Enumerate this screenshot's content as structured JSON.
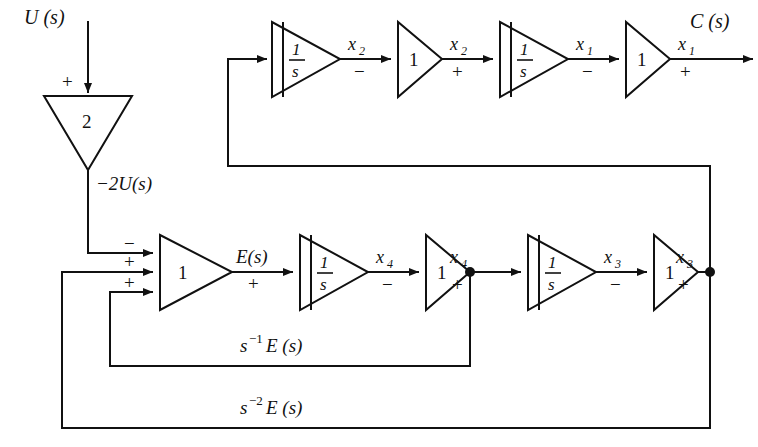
{
  "figure": {
    "kind": "signal-flow-block-diagram",
    "background_color": "#ffffff",
    "line_color": "#111111"
  },
  "signals": {
    "input": "U (s)",
    "output": "C (s)",
    "gain_out": "−2U(s)",
    "error": "E(s)",
    "state_x1": "x",
    "state_x1_sub": "1",
    "state_x2": "x",
    "state_x2_sub": "2",
    "state_x3": "x",
    "state_x3_sub": "3",
    "state_x4": "x",
    "state_x4_sub": "4",
    "feedback_1": "E (s)",
    "feedback_1_pre": "s",
    "feedback_1_exp": "−1",
    "feedback_2": "E (s)",
    "feedback_2_pre": "s",
    "feedback_2_exp": "−2"
  },
  "blocks": {
    "input_gain": {
      "label": "2",
      "name": "gain-2-block"
    },
    "summer": {
      "label": "1",
      "name": "summing-gain-1-block"
    },
    "integrator_label_num": "1",
    "integrator_label_den": "s",
    "unity_gain": "1"
  },
  "top_chain": [
    {
      "type": "integrator",
      "label_num": "1",
      "label_den": "s",
      "out_label": "x",
      "out_sub": "2",
      "out_sign": "−"
    },
    {
      "type": "gain",
      "label": "1",
      "out_label": "x",
      "out_sub": "2",
      "out_sign": "+"
    },
    {
      "type": "integrator",
      "label_num": "1",
      "label_den": "s",
      "out_label": "x",
      "out_sub": "1",
      "out_sign": "−"
    },
    {
      "type": "gain",
      "label": "1",
      "out_label": "x",
      "out_sub": "1",
      "out_sign": "+"
    }
  ],
  "bottom_chain": [
    {
      "type": "summer",
      "label": "1",
      "out_label": "E(s)",
      "out_sign": "+"
    },
    {
      "type": "integrator",
      "label_num": "1",
      "label_den": "s",
      "out_label": "x",
      "out_sub": "4",
      "out_sign": "−"
    },
    {
      "type": "gain",
      "label": "1",
      "out_label": "x",
      "out_sub": "4",
      "out_sign": "+"
    },
    {
      "type": "integrator",
      "label_num": "1",
      "label_den": "s",
      "out_label": "x",
      "out_sub": "3",
      "out_sign": "−"
    },
    {
      "type": "gain",
      "label": "1",
      "out_label": "x",
      "out_sub": "3",
      "out_sign": "+"
    }
  ],
  "summer_inputs": [
    {
      "sign": "−",
      "source": "−2U(s)"
    },
    {
      "sign": "+",
      "source": "s−2E (s)"
    },
    {
      "sign": "+",
      "source": "s−1E (s)"
    }
  ],
  "input_port": {
    "sign": "+",
    "label": "U (s)"
  }
}
